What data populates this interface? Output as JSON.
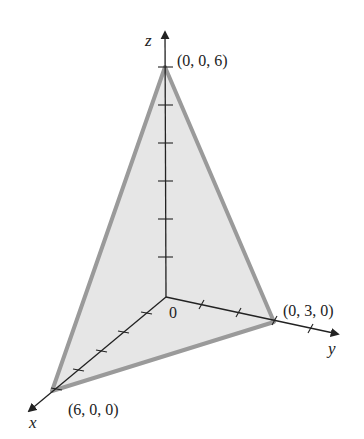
{
  "figure": {
    "type": "3d-plane-intercepts",
    "colors": {
      "fill": "#e6e6e6",
      "edge": "#9a9a9a",
      "axis": "#222222",
      "background": "#ffffff"
    },
    "axes": {
      "x": {
        "label": "x"
      },
      "y": {
        "label": "y"
      },
      "z": {
        "label": "z"
      },
      "origin_label": "0"
    },
    "intercepts": [
      {
        "name": "x-intercept",
        "label": "(6, 0, 0)"
      },
      {
        "name": "y-intercept",
        "label": "(0, 3, 0)"
      },
      {
        "name": "z-intercept",
        "label": "(0, 0, 6)"
      }
    ],
    "ticks": {
      "x": 6,
      "y": 4,
      "z": 6
    }
  }
}
